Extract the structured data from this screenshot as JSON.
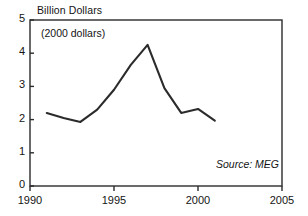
{
  "chart_data": {
    "type": "line",
    "title": "Billion Dollars",
    "subtitle": "(2000 dollars)",
    "source": "Source: MEG",
    "xlabel": "",
    "ylabel": "Billion Dollars",
    "xlim": [
      1990,
      2005
    ],
    "ylim": [
      0,
      5
    ],
    "grid": false,
    "legend": "none",
    "x_ticks": [
      "1990",
      "1995",
      "2000",
      "2005"
    ],
    "x_tick_values": [
      1990,
      1995,
      2000,
      2005
    ],
    "y_ticks": [
      "0",
      "1",
      "2",
      "3",
      "4",
      "5"
    ],
    "y_tick_values": [
      0,
      1,
      2,
      3,
      4,
      5
    ],
    "x": [
      1991,
      1992,
      1993,
      1994,
      1995,
      1996,
      1997,
      1998,
      1999,
      2000,
      2001
    ],
    "values": [
      2.2,
      2.05,
      1.93,
      2.3,
      2.9,
      3.65,
      4.25,
      2.95,
      2.2,
      2.32,
      1.97
    ],
    "series": [
      {
        "name": "Billion Dollars (2000 dollars)",
        "values": [
          2.2,
          2.05,
          1.93,
          2.3,
          2.9,
          3.65,
          4.25,
          2.95,
          2.2,
          2.32,
          1.97
        ]
      }
    ],
    "line_color": "#2b2b2b",
    "axis_color": "#2b2b2b"
  }
}
